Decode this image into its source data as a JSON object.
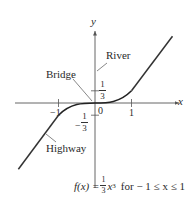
{
  "figure": {
    "type": "function-graph",
    "axes": {
      "x_label": "x",
      "y_label": "y",
      "origin_label": "0",
      "x_ticks": [
        {
          "value": -1,
          "label": "−1"
        },
        {
          "value": 1,
          "label": "1"
        }
      ],
      "y_ticks": [
        {
          "value": 0.3333,
          "label_num": "1",
          "label_den": "3",
          "sign": ""
        },
        {
          "value": -0.3333,
          "label_num": "1",
          "label_den": "3",
          "sign": "−"
        }
      ]
    },
    "annotations": {
      "river": "River",
      "bridge": "Bridge",
      "highway": "Highway"
    },
    "caption": {
      "lhs": "f(x) =",
      "frac_num": "1",
      "frac_den": "3",
      "var": "x",
      "exp": "3",
      "condition": "for − 1 ≤ x ≤ 1"
    },
    "curves": [
      {
        "name": "cubic-bridge",
        "equation": "y = (1/3)x^3",
        "domain": [
          -1,
          1
        ]
      },
      {
        "name": "highway-upper",
        "equation": "y = x - 2/3",
        "domain": [
          1,
          3.1
        ]
      },
      {
        "name": "highway-lower",
        "equation": "y = x + 2/3",
        "domain": [
          -2.15,
          -1
        ]
      }
    ],
    "colors": {
      "axis": "#555555",
      "curve": "#333333",
      "text": "#2a2a2a"
    }
  }
}
